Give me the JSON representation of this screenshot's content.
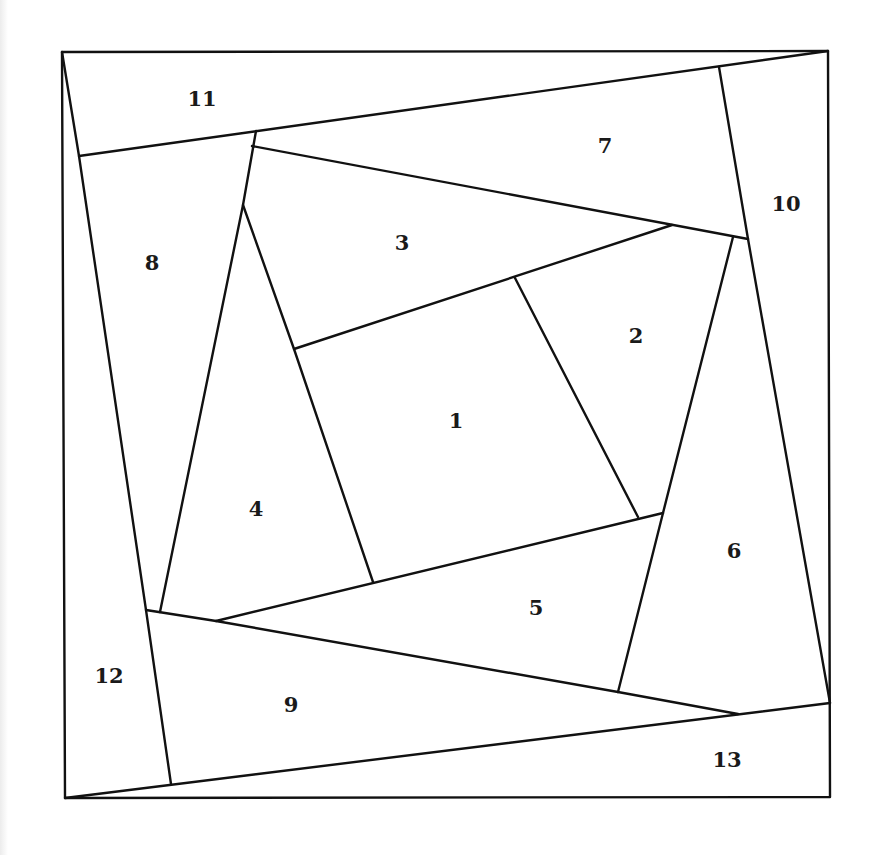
{
  "diagram": {
    "type": "paper-piecing-quilt-block",
    "pieces": [
      {
        "id": "1",
        "label": "1",
        "x": 456,
        "y": 428
      },
      {
        "id": "2",
        "label": "2",
        "x": 636,
        "y": 343
      },
      {
        "id": "3",
        "label": "3",
        "x": 402,
        "y": 250
      },
      {
        "id": "4",
        "label": "4",
        "x": 256,
        "y": 516
      },
      {
        "id": "5",
        "label": "5",
        "x": 536,
        "y": 615
      },
      {
        "id": "6",
        "label": "6",
        "x": 734,
        "y": 558
      },
      {
        "id": "7",
        "label": "7",
        "x": 605,
        "y": 153
      },
      {
        "id": "8",
        "label": "8",
        "x": 152,
        "y": 270
      },
      {
        "id": "9",
        "label": "9",
        "x": 291,
        "y": 712
      },
      {
        "id": "10",
        "label": "10",
        "x": 786,
        "y": 211
      },
      {
        "id": "11",
        "label": "11",
        "x": 202,
        "y": 106
      },
      {
        "id": "12",
        "label": "12",
        "x": 109,
        "y": 683
      },
      {
        "id": "13",
        "label": "13",
        "x": 727,
        "y": 767
      }
    ],
    "line_color": "#111111",
    "background": "#ffffff"
  }
}
